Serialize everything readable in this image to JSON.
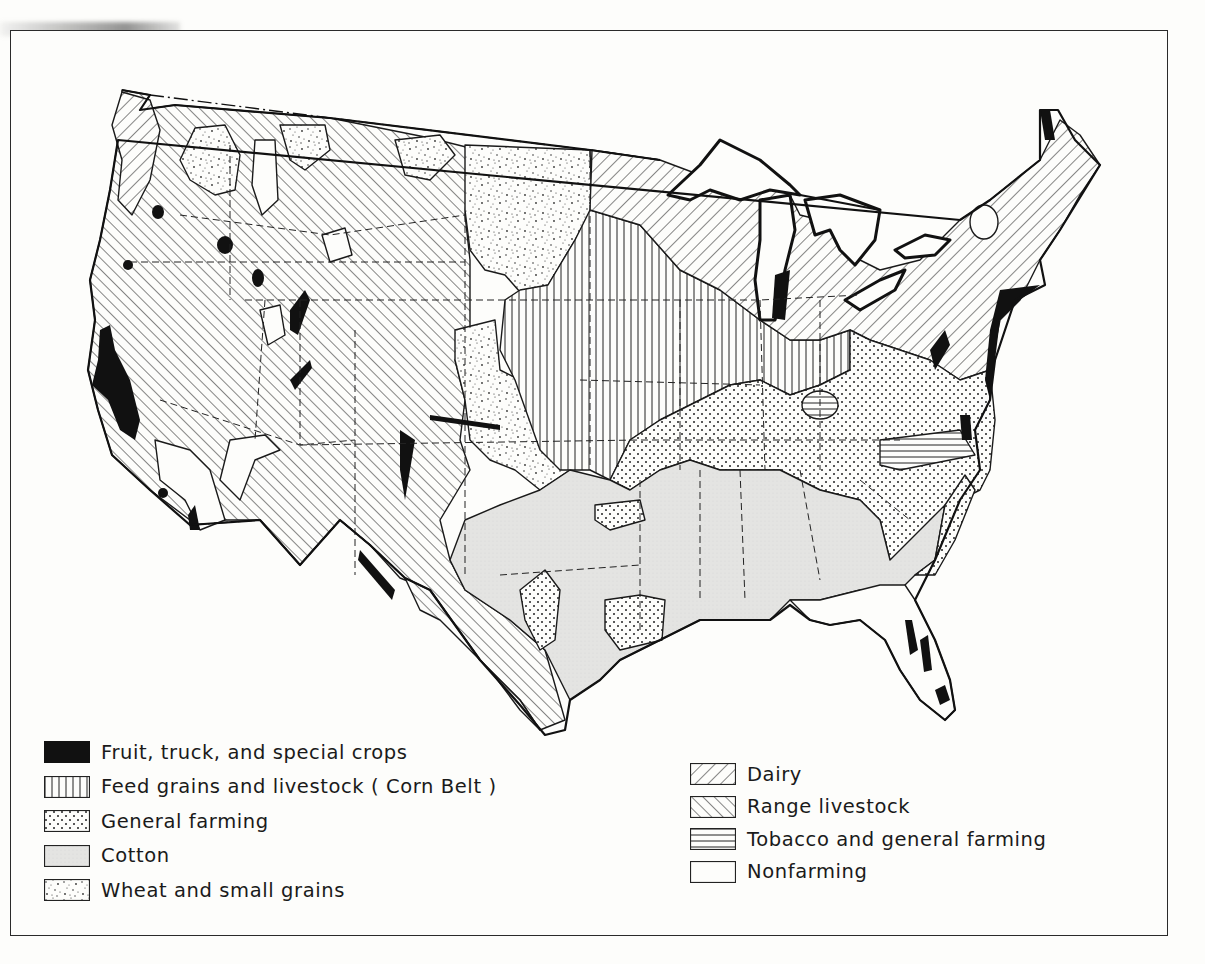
{
  "map": {
    "subject": "Major types of farming in the United States",
    "region": "Contiguous United States",
    "state_boundaries": "dashed lines",
    "international_boundary": "dash-dot line"
  },
  "legend": {
    "left": [
      {
        "id": "fruit",
        "label": "Fruit, truck, and special crops",
        "pattern": "solid-black"
      },
      {
        "id": "feed",
        "label": "Feed grains and livestock ( Corn Belt )",
        "pattern": "vertical-lines"
      },
      {
        "id": "general",
        "label": "General farming",
        "pattern": "regular-dots"
      },
      {
        "id": "cotton",
        "label": "Cotton",
        "pattern": "light-gray-stipple"
      },
      {
        "id": "wheat",
        "label": "Wheat and small grains",
        "pattern": "random-stipple"
      }
    ],
    "right": [
      {
        "id": "dairy",
        "label": "Dairy",
        "pattern": "diagonal-backslash"
      },
      {
        "id": "range",
        "label": "Range livestock",
        "pattern": "diagonal-forwardslash"
      },
      {
        "id": "tobacco",
        "label": "Tobacco and general farming",
        "pattern": "horizontal-lines"
      },
      {
        "id": "nonfarming",
        "label": "Nonfarming",
        "pattern": "blank"
      }
    ]
  },
  "colors": {
    "ink": "#1a1a1a",
    "paper": "#fdfdfb",
    "cotton_fill": "#e4e4e2"
  }
}
